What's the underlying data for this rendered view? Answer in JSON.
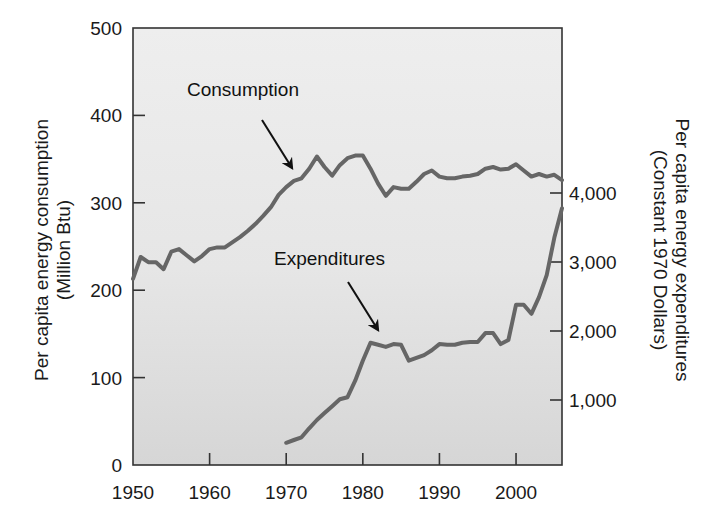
{
  "chart_data": {
    "type": "line",
    "title": "",
    "xlabel": "",
    "ylabel": "Per capita energy consumption (Million Btu)",
    "ylabel_lines": [
      "Per capita energy consumption",
      "(Million Btu)"
    ],
    "y2label": "Per capita energy expenditures (Constant 1970 Dollars)",
    "y2label_lines": [
      "Per capita energy expenditures",
      "(Constant 1970 Dollars)"
    ],
    "xlim": [
      1950,
      2006
    ],
    "ylim": [
      0,
      500
    ],
    "y2lim": [
      0,
      6800
    ],
    "x_ticks": [
      1950,
      1960,
      1970,
      1980,
      1990,
      2000
    ],
    "x_tick_labels": [
      "1950",
      "1960",
      "1970",
      "1980",
      "1990",
      "2000"
    ],
    "y_ticks": [
      0,
      100,
      200,
      300,
      400,
      500
    ],
    "y_tick_labels": [
      "0",
      "100",
      "200",
      "300",
      "400",
      "500"
    ],
    "y2_ticks": [
      1000,
      2000,
      3000,
      4000
    ],
    "y2_tick_labels": [
      "1,000",
      "2,000",
      "3,000",
      "4,000"
    ],
    "grid": false,
    "legend": "none (inline annotations with arrows)",
    "annotations": [
      {
        "text": "Consumption",
        "points_to": "consumption series near 1972"
      },
      {
        "text": "Expenditures",
        "points_to": "expenditures series near 1982"
      }
    ],
    "series": [
      {
        "name": "Consumption",
        "axis": "left",
        "unit": "Million Btu",
        "x": [
          1950,
          1951,
          1952,
          1953,
          1954,
          1955,
          1956,
          1957,
          1958,
          1959,
          1960,
          1961,
          1962,
          1963,
          1964,
          1965,
          1966,
          1967,
          1968,
          1969,
          1970,
          1971,
          1972,
          1973,
          1974,
          1975,
          1976,
          1977,
          1978,
          1979,
          1980,
          1981,
          1982,
          1983,
          1984,
          1985,
          1986,
          1987,
          1988,
          1989,
          1990,
          1991,
          1992,
          1993,
          1994,
          1995,
          1996,
          1997,
          1998,
          1999,
          2000,
          2001,
          2002,
          2003,
          2004,
          2005,
          2006
        ],
        "values": [
          213,
          238,
          232,
          232,
          224,
          244,
          247,
          240,
          233,
          239,
          247,
          249,
          249,
          255,
          261,
          268,
          276,
          285,
          295,
          309,
          318,
          325,
          328,
          339,
          353,
          341,
          331,
          343,
          351,
          354,
          354,
          339,
          322,
          308,
          318,
          316,
          316,
          324,
          333,
          337,
          330,
          328,
          328,
          330,
          331,
          333,
          339,
          341,
          338,
          339,
          344,
          337,
          330,
          333,
          330,
          332,
          326
        ]
      },
      {
        "name": "Expenditures",
        "axis": "right",
        "unit": "Constant 1970 Dollars",
        "x": [
          1970,
          1971,
          1972,
          1973,
          1974,
          1975,
          1976,
          1977,
          1978,
          1979,
          1980,
          1981,
          1982,
          1983,
          1984,
          1985,
          1986,
          1987,
          1988,
          1989,
          1990,
          1991,
          1992,
          1993,
          1994,
          1995,
          1996,
          1997,
          1998,
          1999,
          2000,
          2001,
          2002,
          2003,
          2004,
          2005,
          2006
        ],
        "values": [
          380,
          420,
          460,
          590,
          710,
          810,
          910,
          1010,
          1040,
          1280,
          1570,
          1830,
          1800,
          1770,
          1810,
          1800,
          1570,
          1610,
          1650,
          1720,
          1810,
          1800,
          1800,
          1830,
          1840,
          1840,
          1970,
          1970,
          1810,
          1870,
          2380,
          2380,
          2250,
          2490,
          2810,
          3350,
          3780
        ]
      }
    ]
  },
  "style": {
    "line_color": "#666666",
    "frame_color": "#333333",
    "plot_bg_top": "#ececec",
    "plot_bg_bottom": "#d9d9d9",
    "arrow_color": "#111111"
  }
}
